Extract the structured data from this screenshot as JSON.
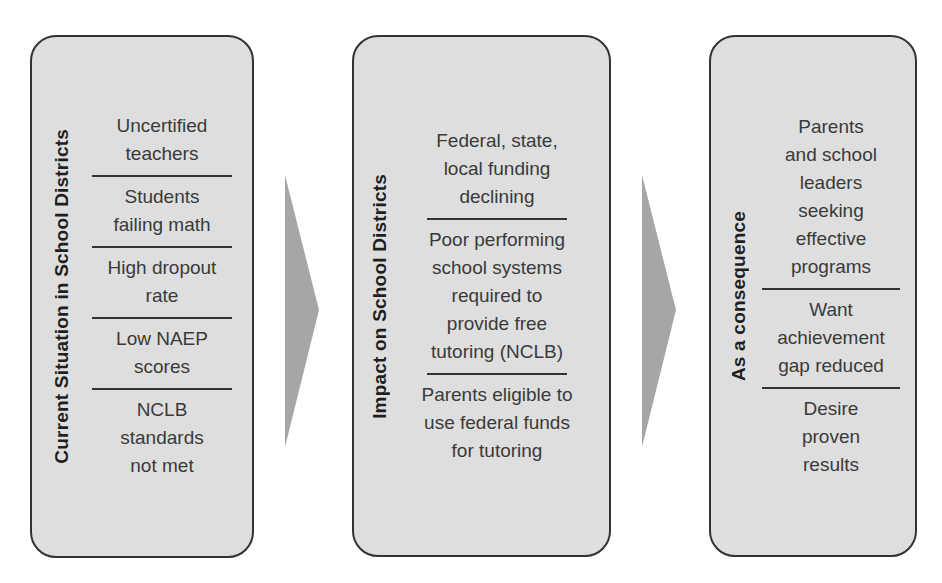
{
  "diagram": {
    "type": "process-flow",
    "colors": {
      "box_fill": "#dedede",
      "box_border": "#333333",
      "arrow_fill": "#a6a6a6",
      "title_text": "#1f1f1f",
      "item_text": "#3a3a3a"
    },
    "columns": [
      {
        "title": "Current Situation in School Districts",
        "items": [
          {
            "label": "Uncertified\nteachers"
          },
          {
            "label": "Students\nfailing math"
          },
          {
            "label": "High dropout\nrate"
          },
          {
            "label": "Low NAEP\nscores"
          },
          {
            "label": "NCLB\nstandards\nnot met"
          }
        ]
      },
      {
        "title": "Impact on School Districts",
        "items": [
          {
            "label": "Federal, state,\nlocal funding\ndeclining"
          },
          {
            "label": "Poor performing\nschool systems\nrequired to\nprovide free\ntutoring (NCLB)"
          },
          {
            "label": "Parents eligible to\nuse federal funds\nfor tutoring"
          }
        ]
      },
      {
        "title": "As a consequence",
        "items": [
          {
            "label": "Parents\nand school\nleaders\nseeking\neffective\nprograms"
          },
          {
            "label": "Want\nachievement\ngap reduced"
          },
          {
            "label": "Desire\nproven\nresults"
          }
        ]
      }
    ],
    "arrows": [
      {
        "from": "Current Situation in School Districts",
        "to": "Impact on School Districts"
      },
      {
        "from": "Impact on School Districts",
        "to": "As a consequence"
      }
    ]
  }
}
